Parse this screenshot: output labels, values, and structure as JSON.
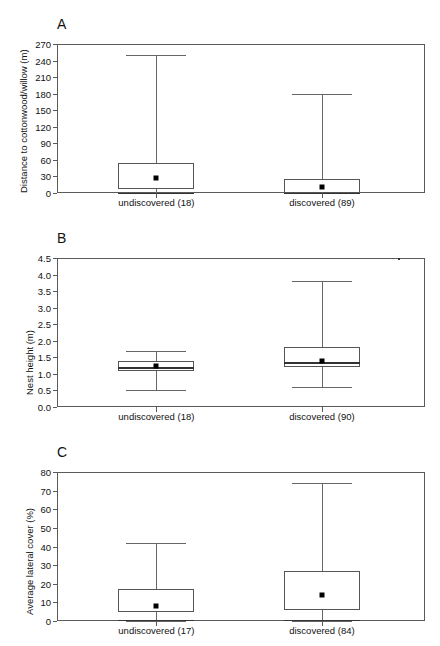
{
  "figure": {
    "background": "#ffffff",
    "line_color": "#555555",
    "marker_color": "#000000"
  },
  "chart_data": [
    {
      "type": "box",
      "panel_letter": "A",
      "title": "",
      "xlabel": "",
      "ylabel": "Distance to cottonwood/willow (m)",
      "ylim": [
        0,
        270
      ],
      "yticks": [
        0,
        30,
        60,
        90,
        120,
        150,
        180,
        210,
        240,
        270
      ],
      "ytick_labels": [
        "0",
        "30",
        "60",
        "90",
        "120",
        "150",
        "180",
        "210",
        "240",
        "270"
      ],
      "grid": false,
      "legend": "none",
      "categories": [
        "undiscovered (18)",
        "discovered (89)"
      ],
      "boxes": [
        {
          "category": "undiscovered (18)",
          "n": 18,
          "whisker_low": 0,
          "q1": 8,
          "median": 0.5,
          "q3": 55,
          "whisker_high": 250,
          "mean": 27
        },
        {
          "category": "discovered (89)",
          "n": 89,
          "whisker_low": 0,
          "q1": 0,
          "median": 0.5,
          "q3": 25,
          "whisker_high": 180,
          "mean": 10
        }
      ]
    },
    {
      "type": "box",
      "panel_letter": "B",
      "title": "",
      "xlabel": "",
      "ylabel": "Nest height (m)",
      "ylim": [
        0.0,
        4.5
      ],
      "yticks": [
        0.0,
        0.5,
        1.0,
        1.5,
        2.0,
        2.5,
        3.0,
        3.5,
        4.0,
        4.5
      ],
      "ytick_labels": [
        "0.0",
        "0.5",
        "1.0",
        "1.5",
        "2.0",
        "2.5",
        "3.0",
        "3.5",
        "4.0",
        "4.5"
      ],
      "grid": false,
      "legend": "none",
      "categories": [
        "undiscovered (18)",
        "discovered (90)"
      ],
      "boxes": [
        {
          "category": "undiscovered (18)",
          "n": 18,
          "whisker_low": 0.5,
          "q1": 1.1,
          "median": 1.2,
          "q3": 1.4,
          "whisker_high": 1.7,
          "mean": 1.25
        },
        {
          "category": "discovered (90)",
          "n": 90,
          "whisker_low": 0.6,
          "q1": 1.2,
          "median": 1.35,
          "q3": 1.8,
          "whisker_high": 3.8,
          "mean": 1.4
        }
      ]
    },
    {
      "type": "box",
      "panel_letter": "C",
      "title": "",
      "xlabel": "",
      "ylabel": "Average lateral cover (%)",
      "ylim": [
        0,
        80
      ],
      "yticks": [
        0,
        10,
        20,
        30,
        40,
        50,
        60,
        70,
        80
      ],
      "ytick_labels": [
        "0",
        "10",
        "20",
        "30",
        "40",
        "50",
        "60",
        "70",
        "80"
      ],
      "grid": false,
      "legend": "none",
      "categories": [
        "undiscovered (17)",
        "discovered (84)"
      ],
      "boxes": [
        {
          "category": "undiscovered (17)",
          "n": 17,
          "whisker_low": 0,
          "q1": 5,
          "median": 0.5,
          "q3": 17,
          "whisker_high": 42,
          "mean": 8
        },
        {
          "category": "discovered (84)",
          "n": 84,
          "whisker_low": 0,
          "q1": 6,
          "median": 0.5,
          "q3": 27,
          "whisker_high": 74,
          "mean": 14
        }
      ]
    }
  ]
}
